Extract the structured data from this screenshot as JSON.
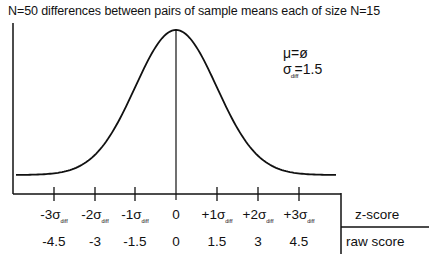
{
  "chart_data": {
    "type": "line",
    "title": "N=50 differences between pairs of sample means each of size N=15",
    "annotations": {
      "mu": "μ=ø",
      "sigma_symbol": "σ",
      "sigma_sub": "diff",
      "sigma_value": "=1.5"
    },
    "x_axis": {
      "rows": [
        {
          "name": "z-score",
          "labels": [
            "-3σ",
            "-2σ",
            "-1σ",
            "0",
            "+1σ",
            "+2σ",
            "+3σ"
          ],
          "sub": [
            "diff",
            "diff",
            "diff",
            "",
            "diff",
            "diff",
            "diff"
          ]
        },
        {
          "name": "raw score",
          "labels": [
            "-4.5",
            "-3",
            "-1.5",
            "0",
            "1.5",
            "3",
            "4.5"
          ]
        }
      ],
      "z_values": [
        -3,
        -2,
        -1,
        0,
        1,
        2,
        3
      ],
      "raw_values": [
        -4.5,
        -3,
        -1.5,
        0,
        1.5,
        3,
        4.5
      ]
    },
    "series": [
      {
        "name": "normal curve",
        "mean": 0,
        "sd": 1.5,
        "x_range": [
          -4.0,
          4.0
        ]
      }
    ],
    "xlabel": "",
    "ylabel": "",
    "grid": false,
    "legend": "none"
  },
  "labels": {
    "title": "N=50 differences between pairs of sample means each of size N=15",
    "mu": "μ=ø",
    "sigma": "σ",
    "diff": "diff",
    "sigma_value": "=1.5",
    "z_row": "z-score",
    "raw_row": "raw score",
    "z_ticks": [
      {
        "main": "-3σ",
        "sub": "diff"
      },
      {
        "main": "-2σ",
        "sub": "diff"
      },
      {
        "main": "-1σ",
        "sub": "diff"
      },
      {
        "main": "0",
        "sub": ""
      },
      {
        "main": "+1σ",
        "sub": "diff"
      },
      {
        "main": "+2σ",
        "sub": "diff"
      },
      {
        "main": "+3σ",
        "sub": "diff"
      }
    ],
    "raw_ticks": [
      "-4.5",
      "-3",
      "-1.5",
      "0",
      "1.5",
      "3",
      "4.5"
    ]
  }
}
